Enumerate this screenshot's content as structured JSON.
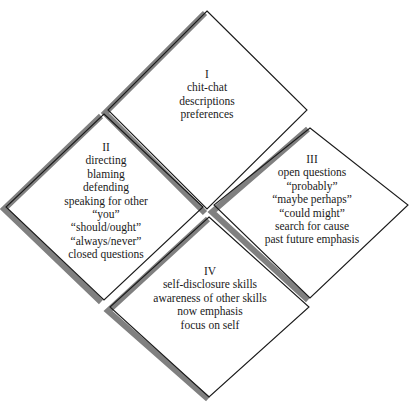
{
  "diagram": {
    "colors": {
      "outline": "#1a1a1a",
      "shadow": "#808080",
      "background": "#ffffff",
      "text": "#1a1a1a"
    },
    "quadrants": [
      {
        "id": "quadrant-1",
        "roman": "I",
        "lines": [
          "chit-chat",
          "descriptions",
          "preferences"
        ]
      },
      {
        "id": "quadrant-2",
        "roman": "II",
        "lines": [
          "directing",
          "blaming",
          "defending",
          "speaking for other",
          "“you”",
          "“should/ought”",
          "“always/never”",
          "closed questions"
        ]
      },
      {
        "id": "quadrant-3",
        "roman": "III",
        "lines": [
          "open questions",
          "“probably”",
          "“maybe perhaps”",
          "“could might”",
          "search for cause",
          "past future emphasis"
        ]
      },
      {
        "id": "quadrant-4",
        "roman": "IV",
        "lines": [
          "self-disclosure skills",
          "awareness of other skills",
          "now emphasis",
          "focus on self"
        ]
      }
    ]
  }
}
